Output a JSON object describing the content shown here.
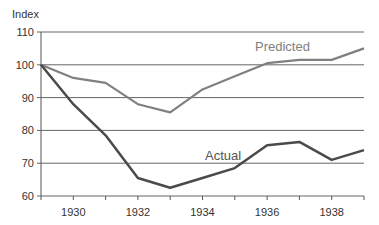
{
  "chart_data": {
    "type": "line",
    "title": "",
    "xlabel": "",
    "ylabel": "Index",
    "x": [
      1929,
      1930,
      1931,
      1932,
      1933,
      1934,
      1935,
      1936,
      1937,
      1938,
      1939
    ],
    "xlim": [
      1929,
      1939
    ],
    "ylim": [
      60,
      110
    ],
    "yticks": [
      60,
      70,
      80,
      90,
      100,
      110
    ],
    "xtick_labels": [
      "1930",
      "1932",
      "1934",
      "1936",
      "1938"
    ],
    "ytick_labels": [
      "60",
      "70",
      "80",
      "90",
      "100",
      "110"
    ],
    "grid": "horizontal",
    "legend": "inline labels",
    "series": [
      {
        "name": "Predicted",
        "color": "#808080",
        "values": [
          100,
          96,
          94.5,
          88,
          85.5,
          92.5,
          96.5,
          100.5,
          101.5,
          101.5,
          105
        ]
      },
      {
        "name": "Actual",
        "color": "#4a4a4a",
        "values": [
          100,
          88,
          78.5,
          65.5,
          62.5,
          65.5,
          68.5,
          75.5,
          76.5,
          71,
          74
        ]
      }
    ]
  },
  "labels": {
    "ylabel": "Index",
    "predicted": "Predicted",
    "actual": "Actual"
  }
}
